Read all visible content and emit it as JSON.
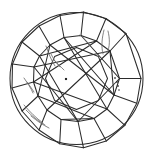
{
  "plot": {
    "title": "Round brilliant diamond clarity plot",
    "view": "crown",
    "background_color": "#ffffff",
    "line_color": "#2b2b2b",
    "inclusion_color": "#262626",
    "feather_color": "#6e6e6e",
    "canvas": {
      "width": 156,
      "height": 158
    }
  },
  "chart_data": {
    "type": "diagram",
    "shape": "round-brilliant",
    "girdle": {
      "label": "girdle-circle",
      "center_x": 76.5,
      "center_y": 78.5,
      "radius_x": 66.5,
      "radius_y": 66.0
    },
    "table": {
      "label": "table-octagon",
      "sides": 8,
      "radius": 31.0,
      "rotation_deg": 22.5
    },
    "star_ring": {
      "label": "star-facet-ring",
      "radius": 43.0,
      "rotation_deg": 0
    },
    "girdle_vertices": 16,
    "bezel_facets": 8,
    "star_facets": 8,
    "upper_girdle_facets": 16,
    "inclusions": [
      {
        "name": "center-crystal",
        "type": "crystal",
        "x": 66,
        "y": 79,
        "size": 2.1
      },
      {
        "name": "right-pinpoint-1",
        "type": "pinpoint",
        "x": 115,
        "y": 78,
        "size": 1.5
      },
      {
        "name": "right-pinpoint-2",
        "type": "pinpoint",
        "x": 117,
        "y": 82,
        "size": 1.5
      },
      {
        "name": "right-pinpoint-3",
        "type": "pinpoint",
        "x": 118,
        "y": 86,
        "size": 1.5
      },
      {
        "name": "right-pinpoint-4",
        "type": "pinpoint",
        "x": 119,
        "y": 90,
        "size": 1.3
      }
    ],
    "feathers": [
      {
        "name": "upper-right-feather",
        "path": "M104,30 C102,38 101,46 103,54"
      },
      {
        "name": "upper-right-feather-2",
        "path": "M108,31 C110,39 110,47 107,53"
      },
      {
        "name": "top-center-feather",
        "path": "M80,35 C84,39 88,42 90,46"
      },
      {
        "name": "mid-left-feather",
        "path": "M46,46 C49,54 51,60 55,66"
      },
      {
        "name": "mid-left-feather-2",
        "path": "M51,54 C54,60 56,63 60,67"
      },
      {
        "name": "left-feather",
        "path": "M24,78 C28,84 31,88 33,93"
      },
      {
        "name": "left-feather-2",
        "path": "M27,82 C30,86 32,89 34,92"
      },
      {
        "name": "lower-left-feather",
        "path": "M24,105 C30,112 36,118 43,123"
      },
      {
        "name": "lower-left-feather-2",
        "path": "M26,110 C32,116 38,121 45,125"
      },
      {
        "name": "lower-left-feather-3",
        "path": "M31,116 C37,121 43,125 49,128"
      },
      {
        "name": "center-star-scratch",
        "path": "M54,60 C58,64 61,67 64,70"
      }
    ]
  }
}
